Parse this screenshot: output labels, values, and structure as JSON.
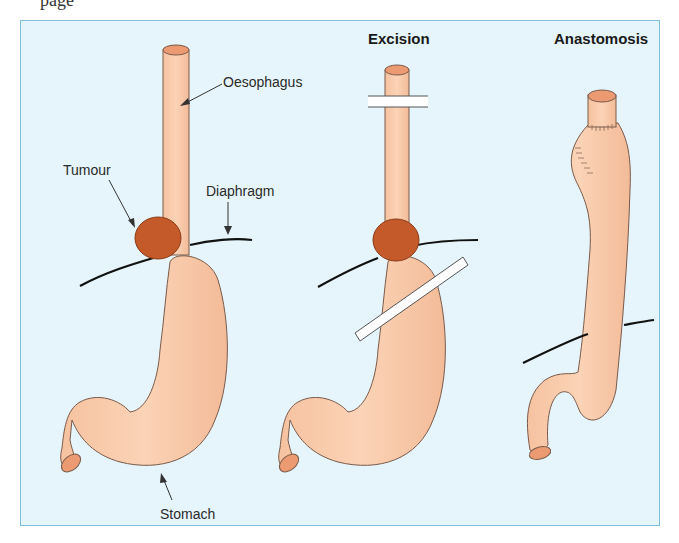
{
  "figure": {
    "clipped_header_text": "page",
    "panels": [
      {
        "id": "before",
        "title": ""
      },
      {
        "id": "excision",
        "title": "Excision"
      },
      {
        "id": "anastomosis",
        "title": "Anastomosis"
      }
    ],
    "labels": {
      "oesophagus": "Oesophagus",
      "tumour": "Tumour",
      "diaphragm": "Diaphragm",
      "stomach": "Stomach"
    },
    "colors": {
      "background": "#e6f5fb",
      "border": "#7fbfe0",
      "organ_fill": "#f8c9a8",
      "organ_outline": "#7a5a4a",
      "lumen": "#ec9a72",
      "tumour": "#c45a2a",
      "diaphragm": "#111111",
      "clamp": "#ffffff"
    }
  }
}
